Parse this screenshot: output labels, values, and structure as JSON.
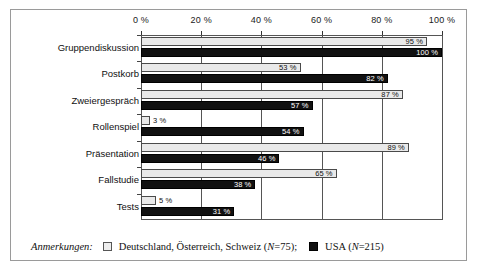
{
  "chart_data": {
    "type": "bar",
    "orientation": "horizontal",
    "title": "",
    "xlabel": "",
    "ylabel": "",
    "xlim": [
      0,
      100
    ],
    "xticks": [
      0,
      20,
      40,
      60,
      80,
      100
    ],
    "xticklabels": [
      "0 %",
      "20 %",
      "40 %",
      "60 %",
      "80 %",
      "100 %"
    ],
    "grid": true,
    "legend_position": "bottom",
    "categories": [
      "Gruppendiskussion",
      "Postkorb",
      "Zweiergespräch",
      "Rollenspiel",
      "Präsentation",
      "Fallstudie",
      "Tests"
    ],
    "series": [
      {
        "name": "Deutschland, Österreich, Schweiz (N=75)",
        "color": "#e9e9e9",
        "values": [
          95,
          53,
          87,
          3,
          89,
          65,
          5
        ],
        "labels": [
          "95 %",
          "53 %",
          "87 %",
          "3 %",
          "89 %",
          "65 %",
          "5 %"
        ]
      },
      {
        "name": "USA (N=215)",
        "color": "#111111",
        "values": [
          100,
          82,
          57,
          54,
          46,
          38,
          31
        ],
        "labels": [
          "100 %",
          "82 %",
          "57 %",
          "54 %",
          "46 %",
          "38 %",
          "31 %"
        ]
      }
    ]
  },
  "legend": {
    "title": "Anmerkungen:",
    "entries": [
      {
        "swatch": "light",
        "text": "Deutschland, Österreich, Schweiz (",
        "nvar": "N",
        "ntail": "=75);"
      },
      {
        "swatch": "dark",
        "text": "USA (",
        "nvar": "N",
        "ntail": "=215)"
      }
    ]
  }
}
